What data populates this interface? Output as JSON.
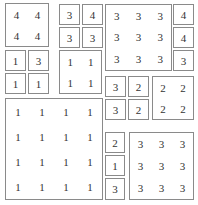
{
  "puzzle": {
    "boxes": [
      {
        "id": "a",
        "x": 5,
        "y": 3,
        "w": 44,
        "h": 44,
        "cols": 2,
        "values": [
          "4",
          "4",
          "4",
          "4"
        ]
      },
      {
        "id": "b",
        "x": 59,
        "y": 4,
        "w": 21,
        "h": 21,
        "cols": 1,
        "values": [
          "3"
        ]
      },
      {
        "id": "c",
        "x": 82,
        "y": 4,
        "w": 21,
        "h": 21,
        "cols": 1,
        "values": [
          "4"
        ]
      },
      {
        "id": "d",
        "x": 59,
        "y": 27,
        "w": 21,
        "h": 21,
        "cols": 1,
        "values": [
          "3"
        ]
      },
      {
        "id": "e",
        "x": 82,
        "y": 27,
        "w": 21,
        "h": 21,
        "cols": 1,
        "values": [
          "3"
        ]
      },
      {
        "id": "f",
        "x": 105,
        "y": 4,
        "w": 67,
        "h": 67,
        "cols": 3,
        "values": [
          "3",
          "3",
          "3",
          "3",
          "3",
          "3",
          "3",
          "3",
          "3"
        ]
      },
      {
        "id": "g",
        "x": 173,
        "y": 4,
        "w": 21,
        "h": 21,
        "cols": 1,
        "values": [
          "4"
        ]
      },
      {
        "id": "h",
        "x": 173,
        "y": 27,
        "w": 21,
        "h": 21,
        "cols": 1,
        "values": [
          "4"
        ]
      },
      {
        "id": "i",
        "x": 173,
        "y": 50,
        "w": 21,
        "h": 21,
        "cols": 1,
        "values": [
          "3"
        ]
      },
      {
        "id": "j",
        "x": 5,
        "y": 50,
        "w": 21,
        "h": 21,
        "cols": 1,
        "values": [
          "1"
        ]
      },
      {
        "id": "k",
        "x": 28,
        "y": 50,
        "w": 21,
        "h": 21,
        "cols": 1,
        "values": [
          "3"
        ]
      },
      {
        "id": "l",
        "x": 5,
        "y": 73,
        "w": 21,
        "h": 21,
        "cols": 1,
        "values": [
          "1"
        ]
      },
      {
        "id": "m",
        "x": 28,
        "y": 73,
        "w": 21,
        "h": 21,
        "cols": 1,
        "values": [
          "1"
        ]
      },
      {
        "id": "n",
        "x": 59,
        "y": 50,
        "w": 43,
        "h": 44,
        "cols": 2,
        "values": [
          "1",
          "1",
          "1",
          "1"
        ]
      },
      {
        "id": "o",
        "x": 105,
        "y": 76,
        "w": 21,
        "h": 21,
        "cols": 1,
        "values": [
          "3"
        ]
      },
      {
        "id": "p",
        "x": 128,
        "y": 76,
        "w": 21,
        "h": 21,
        "cols": 1,
        "values": [
          "2"
        ]
      },
      {
        "id": "q",
        "x": 105,
        "y": 99,
        "w": 21,
        "h": 21,
        "cols": 1,
        "values": [
          "3"
        ]
      },
      {
        "id": "r",
        "x": 128,
        "y": 99,
        "w": 21,
        "h": 21,
        "cols": 1,
        "values": [
          "2"
        ]
      },
      {
        "id": "s",
        "x": 152,
        "y": 76,
        "w": 42,
        "h": 44,
        "cols": 2,
        "values": [
          "2",
          "2",
          "2",
          "2"
        ]
      },
      {
        "id": "t",
        "x": 5,
        "y": 98,
        "w": 98,
        "h": 102,
        "cols": 4,
        "values": [
          "1",
          "1",
          "1",
          "1",
          "1",
          "1",
          "1",
          "1",
          "1",
          "1",
          "1",
          "1",
          "1",
          "1",
          "1",
          "1"
        ]
      },
      {
        "id": "u",
        "x": 105,
        "y": 132,
        "w": 20,
        "h": 21,
        "cols": 1,
        "values": [
          "2"
        ]
      },
      {
        "id": "v",
        "x": 105,
        "y": 155,
        "w": 20,
        "h": 21,
        "cols": 1,
        "values": [
          "1"
        ]
      },
      {
        "id": "w",
        "x": 105,
        "y": 178,
        "w": 20,
        "h": 22,
        "cols": 1,
        "values": [
          "3"
        ]
      },
      {
        "id": "x",
        "x": 129,
        "y": 132,
        "w": 65,
        "h": 68,
        "cols": 3,
        "values": [
          "3",
          "3",
          "3",
          "3",
          "3",
          "3",
          "3",
          "3",
          "3"
        ]
      }
    ]
  }
}
